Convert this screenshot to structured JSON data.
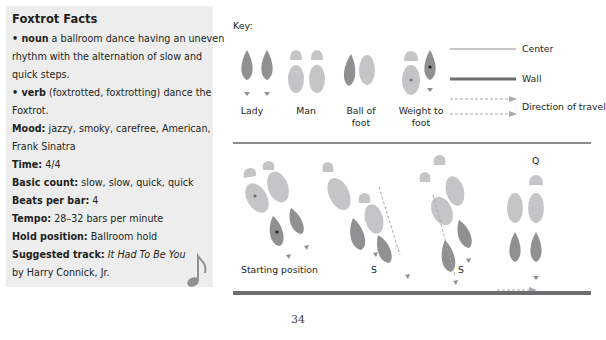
{
  "sidebar": {
    "title": "Foxtrot Facts",
    "noun_label": "• noun",
    "noun_text": " a ballroom dance having an uneven",
    "noun_text2": "rhythm with the alternation of slow and",
    "noun_text3": "quick steps.",
    "verb_label": "• verb",
    "verb_text": " (foxtrotted, foxtrotting) dance the",
    "verb_text2": "Foxtrot.",
    "mood_label": "Mood:",
    "mood_text": " jazzy, smoky, carefree, American,",
    "mood_text2": "Frank Sinatra",
    "time_label": "Time:",
    "time_value": " 4/4",
    "count_label": "Basic count:",
    "count_value": " slow, slow, quick, quick",
    "beats_label": "Beats per bar:",
    "beats_value": " 4",
    "tempo_label": "Tempo:",
    "tempo_value": " 28–32 bars per minute",
    "hold_label": "Hold position:",
    "hold_value": " Ballroom hold",
    "track_label": "Suggested track:",
    "track_title": " It Had To Be You",
    "track_artist": "by Harry Connick, Jr.",
    "icon": "music-note-icon"
  },
  "key": {
    "title": "Key:",
    "lady": "Lady",
    "man": "Man",
    "ball1": "Ball of",
    "ball2": "foot",
    "weight1": "Weight to",
    "weight2": "foot",
    "center": "Center",
    "wall": "Wall",
    "direction": "Direction of travel"
  },
  "steps": {
    "start": "Starting position",
    "s1": "S",
    "s2": "S",
    "q": "Q"
  },
  "colors": {
    "lady": "#8f9092",
    "man": "#c4c5c7",
    "sidebar_bg": "#ededee"
  },
  "page": {
    "number": "34"
  }
}
